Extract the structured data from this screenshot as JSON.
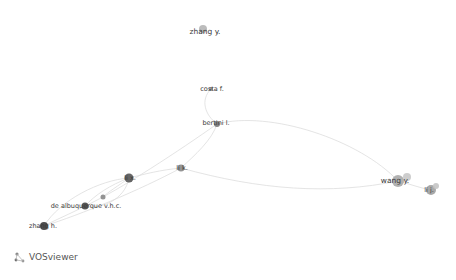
{
  "app": {
    "name": "VOSviewer"
  },
  "network": {
    "nodes": [
      {
        "id": "zhang_y",
        "label": "zhang y.",
        "x": 203,
        "y": 29,
        "r": 4,
        "color": "#b5b5b5"
      },
      {
        "id": "costa_f",
        "label": "costa f.",
        "x": 211,
        "y": 89,
        "r": 2,
        "color": "#8c8c8c"
      },
      {
        "id": "bertini_l",
        "label": "bertini l.",
        "x": 217,
        "y": 124,
        "r": 3,
        "color": "#777777"
      },
      {
        "id": "li_k",
        "label": "li k.",
        "x": 181,
        "y": 168,
        "r": 3.5,
        "color": "#888888"
      },
      {
        "id": "li_x",
        "label": "li x.",
        "x": 129,
        "y": 178,
        "r": 4.5,
        "color": "#555555"
      },
      {
        "id": "node_small",
        "label": "",
        "x": 103,
        "y": 197,
        "r": 2.5,
        "color": "#888888"
      },
      {
        "id": "de_albuquerque",
        "label": "de albuquerque v.h.c.",
        "x": 85,
        "y": 206,
        "r": 3.5,
        "color": "#444444"
      },
      {
        "id": "zhang_h",
        "label": "zhang h.",
        "x": 44,
        "y": 226,
        "r": 4,
        "color": "#3a3a3a"
      },
      {
        "id": "wang_y",
        "label": "wang y.",
        "x": 398,
        "y": 181,
        "r": 6,
        "color": "#a8a8a8"
      },
      {
        "id": "wang_y2",
        "label": "",
        "x": 407,
        "y": 177,
        "r": 4,
        "color": "#c8c8c8"
      },
      {
        "id": "li_j",
        "label": "li j.",
        "x": 431,
        "y": 190,
        "r": 5,
        "color": "#a0a0a0"
      },
      {
        "id": "li_j2",
        "label": "",
        "x": 436,
        "y": 186,
        "r": 3,
        "color": "#c4c4c4"
      }
    ],
    "edges": [
      {
        "from": "costa_f",
        "to": "bertini_l",
        "path": "M211,89 C200,100 205,115 217,124"
      },
      {
        "from": "bertini_l",
        "to": "li_k",
        "path": "M217,124 C212,140 195,155 181,168"
      },
      {
        "from": "bertini_l",
        "to": "wang_y",
        "path": "M217,124 C270,110 360,140 398,181"
      },
      {
        "from": "li_k",
        "to": "wang_y",
        "path": "M181,168 C260,190 330,195 398,181"
      },
      {
        "from": "li_k",
        "to": "li_x",
        "path": "M181,168 C160,170 145,174 129,178"
      },
      {
        "from": "li_x",
        "to": "de_albuquerque",
        "path": "M129,178 C110,185 95,195 85,206"
      },
      {
        "from": "li_x",
        "to": "zhang_h",
        "path": "M129,178 C100,180 60,200 44,226"
      },
      {
        "from": "de_albuquerque",
        "to": "zhang_h",
        "path": "M85,206 C70,214 55,220 44,226"
      },
      {
        "from": "li_x",
        "to": "node_small",
        "path": "M129,178 C118,186 108,192 103,197"
      },
      {
        "from": "bertini_l",
        "to": "de_albuquerque",
        "path": "M217,124 C180,150 120,190 85,206"
      },
      {
        "from": "li_k",
        "to": "zhang_h",
        "path": "M181,168 C140,190 80,215 44,226"
      },
      {
        "from": "wang_y",
        "to": "li_j",
        "path": "M398,181 C410,184 420,188 431,190"
      },
      {
        "from": "li_x",
        "to": "de_albuquerque_b",
        "path": "M129,178 C125,200 100,210 85,206"
      }
    ],
    "edge_color": "#d9d9d9"
  },
  "labels": [
    {
      "text": "zhang y.",
      "x": 205,
      "y": 32,
      "size": "big"
    },
    {
      "text": "costa f.",
      "x": 212,
      "y": 89,
      "size": ""
    },
    {
      "text": "bertini l.",
      "x": 216,
      "y": 123,
      "size": ""
    },
    {
      "text": "li k.",
      "x": 182,
      "y": 168,
      "size": ""
    },
    {
      "text": "li x.",
      "x": 130,
      "y": 178,
      "size": ""
    },
    {
      "text": "de albuquerque v.h.c.",
      "x": 86,
      "y": 206,
      "size": ""
    },
    {
      "text": "zhang h.",
      "x": 43,
      "y": 226,
      "size": ""
    },
    {
      "text": "wang y.",
      "x": 395,
      "y": 181,
      "size": "big"
    },
    {
      "text": "li j.",
      "x": 429,
      "y": 190,
      "size": ""
    }
  ]
}
